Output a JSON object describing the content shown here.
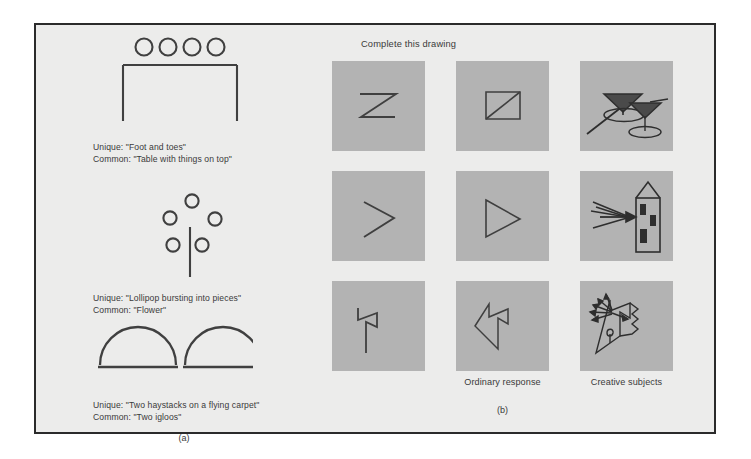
{
  "figure": {
    "background_color": "#ececeb",
    "border_color": "#2b2b2b",
    "cell_color": "#b3b3b3",
    "ink_color": "#3a3a3a"
  },
  "panel_a": {
    "label": "(a)",
    "stimuli": [
      {
        "name": "table-with-circles",
        "unique_label": "Unique: \"Foot and toes\"",
        "common_label": "Common: \"Table with things on top\""
      },
      {
        "name": "stem-with-circles",
        "unique_label": "Unique: \"Lollipop bursting into pieces\"",
        "common_label": "Common: \"Flower\""
      },
      {
        "name": "two-semicircles",
        "unique_label": "Unique: \"Two haystacks on a flying carpet\"",
        "common_label": "Common: \"Two igloos\""
      }
    ]
  },
  "panel_b": {
    "label": "(b)",
    "heading": "Complete this drawing",
    "column_labels": [
      "",
      "Ordinary response",
      "Creative subjects"
    ],
    "rows": [
      {
        "stimulus_name": "zigzag-z-stimulus",
        "ordinary_name": "square-with-diagonal",
        "creative_name": "two-cocktail-glasses"
      },
      {
        "stimulus_name": "chevron-stimulus",
        "ordinary_name": "triangle-outline",
        "creative_name": "arrow-striking-tower"
      },
      {
        "stimulus_name": "flag-hook-stimulus",
        "ordinary_name": "angular-polygon",
        "creative_name": "face-kite-with-rays"
      }
    ]
  }
}
